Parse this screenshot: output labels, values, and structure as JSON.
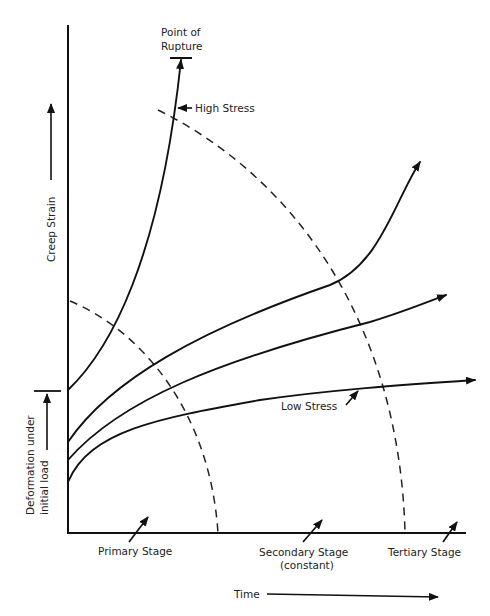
{
  "diagram": {
    "type": "creep-curve",
    "y_axis_label": "Creep Strain",
    "y_axis_sub_label_line1": "Deformation under",
    "y_axis_sub_label_line2": "initial load",
    "x_axis_label": "Time",
    "rupture_label_line1": "Point of",
    "rupture_label_line2": "Rupture",
    "high_stress_label": "High Stress",
    "low_stress_label": "Low Stress",
    "stages": [
      {
        "label": "Primary Stage",
        "sub": ""
      },
      {
        "label": "Secondary Stage",
        "sub": "(constant)"
      },
      {
        "label": "Tertiary Stage",
        "sub": ""
      }
    ],
    "curves": [
      {
        "name": "High Stress",
        "ends_in": "rupture"
      },
      {
        "name": "Intermediate Stress 1",
        "ends_in": "arrow"
      },
      {
        "name": "Intermediate Stress 2",
        "ends_in": "arrow"
      },
      {
        "name": "Low Stress",
        "ends_in": "arrow"
      }
    ],
    "colors": {
      "line": "#111111",
      "background": "#ffffff"
    }
  }
}
